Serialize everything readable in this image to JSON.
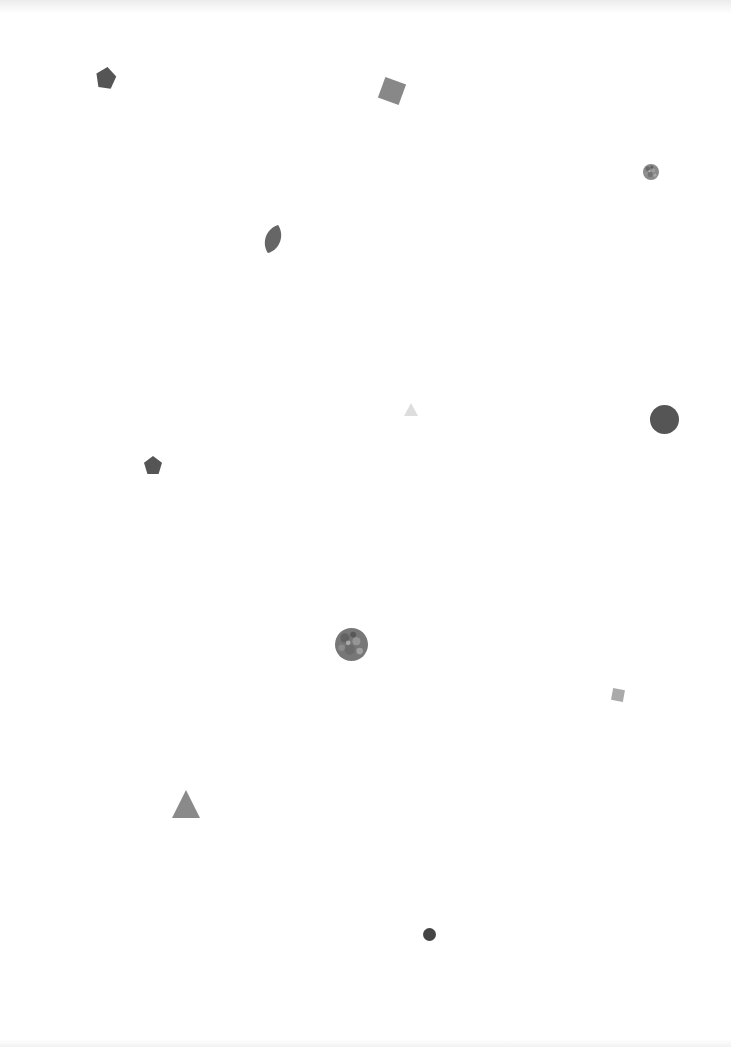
{
  "canvas": {
    "width": 731,
    "height": 1047,
    "background": "#ffffff"
  },
  "shapes": [
    {
      "id": "pentagon-1",
      "type": "pentagon",
      "x": 96,
      "y": 67,
      "w": 20,
      "h": 21,
      "color": "#555555",
      "rotate": 8
    },
    {
      "id": "square-1",
      "type": "square",
      "x": 381,
      "y": 80,
      "w": 22,
      "h": 22,
      "color": "#888888",
      "rotate": 20
    },
    {
      "id": "circle-textured-small",
      "type": "circle",
      "x": 643,
      "y": 164,
      "w": 16,
      "h": 16,
      "color": "#8a8a8a",
      "textured": true
    },
    {
      "id": "leaf-1",
      "type": "leaf",
      "x": 263,
      "y": 224,
      "w": 20,
      "h": 30,
      "color": "#666666",
      "rotate": 20
    },
    {
      "id": "triangle-light",
      "type": "triangle",
      "x": 404,
      "y": 403,
      "w": 14,
      "h": 13,
      "color": "#dddddd"
    },
    {
      "id": "circle-large",
      "type": "circle",
      "x": 650,
      "y": 405,
      "w": 29,
      "h": 29,
      "color": "#555555"
    },
    {
      "id": "pentagon-2",
      "type": "pentagon",
      "x": 144,
      "y": 456,
      "w": 18,
      "h": 18,
      "color": "#555555",
      "rotate": 0
    },
    {
      "id": "circle-textured-large",
      "type": "circle",
      "x": 335,
      "y": 628,
      "w": 33,
      "h": 33,
      "color": "#777777",
      "textured": true
    },
    {
      "id": "square-small",
      "type": "square",
      "x": 612,
      "y": 689,
      "w": 12,
      "h": 12,
      "color": "#aaaaaa",
      "rotate": 10
    },
    {
      "id": "triangle-large",
      "type": "triangle",
      "x": 172,
      "y": 790,
      "w": 28,
      "h": 28,
      "color": "#8a8a8a"
    },
    {
      "id": "circle-small-dark",
      "type": "circle",
      "x": 423,
      "y": 928,
      "w": 13,
      "h": 13,
      "color": "#444444"
    }
  ]
}
